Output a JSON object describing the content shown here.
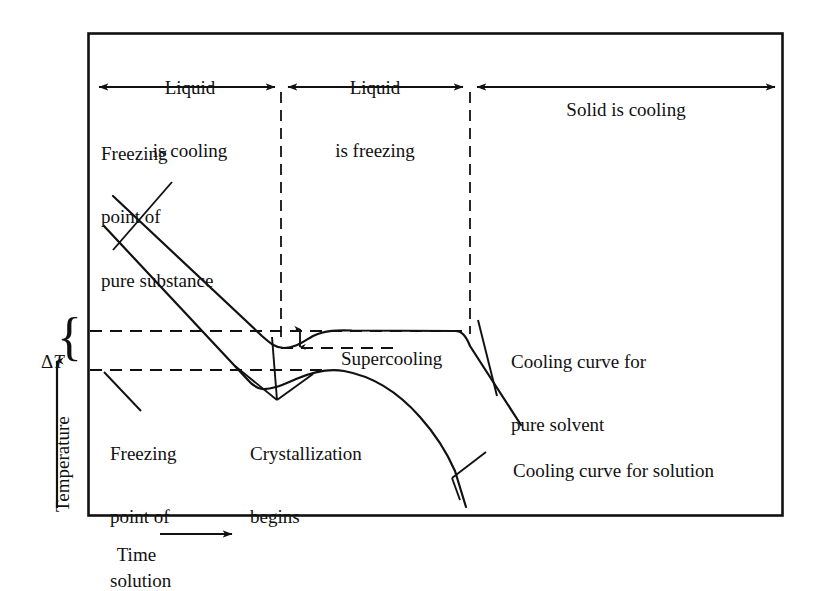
{
  "figure": {
    "type": "diagram",
    "axes": {
      "y_label": "Temperature",
      "x_label": "Time",
      "y_arrow": "up-arrow",
      "x_arrow": "right-arrow"
    },
    "zones": [
      {
        "id": "zone-liquid-cooling",
        "line1": "Liquid",
        "line2": "is cooling"
      },
      {
        "id": "zone-liquid-freezing",
        "line1": "Liquid",
        "line2": "is freezing"
      },
      {
        "id": "zone-solid-cooling",
        "line1": "Solid is cooling",
        "line2": ""
      }
    ],
    "annotations": {
      "freezing_point_pure": "Freezing\npoint of\npure substance",
      "freezing_point_pure_l1": "Freezing",
      "freezing_point_pure_l2": "point of",
      "freezing_point_pure_l3": "pure substance",
      "freezing_point_solution_l1": "Freezing",
      "freezing_point_solution_l2": "point of",
      "freezing_point_solution_l3": "solution",
      "crystallization_l1": "Crystallization",
      "crystallization_l2": "begins",
      "supercooling": "Supercooling",
      "curve_pure_l1": "Cooling curve for",
      "curve_pure_l2": "pure solvent",
      "curve_solution": "Cooling curve for solution",
      "delta_t_symbol": "Δ",
      "delta_t_variable": "T"
    },
    "colors": {
      "ink": "#111111",
      "background": "#ffffff"
    },
    "geometry_notes": {
      "freezing_point_pure_level_y": 331,
      "freezing_point_solution_level_y": 370,
      "freeze_start_x": 281,
      "freeze_end_x": 470
    }
  }
}
